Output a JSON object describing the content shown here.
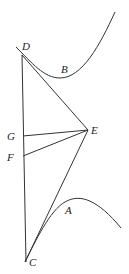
{
  "diagram": {
    "type": "geometric-construction",
    "stroke_color": "#333333",
    "label_color": "#222222",
    "points": {
      "D": {
        "label": "D",
        "x": 22,
        "y": 55
      },
      "B": {
        "label": "B",
        "x": 65,
        "y": 70
      },
      "E": {
        "label": "E",
        "x": 88,
        "y": 130
      },
      "G": {
        "label": "G",
        "x": 23,
        "y": 136
      },
      "F": {
        "label": "F",
        "x": 23,
        "y": 156
      },
      "A": {
        "label": "A",
        "x": 70,
        "y": 211
      },
      "C": {
        "label": "C",
        "x": 25,
        "y": 262
      }
    },
    "segments": [
      "DC",
      "DE",
      "GE",
      "FE",
      "CE"
    ],
    "curves": [
      {
        "name": "upper-curve",
        "through": "B",
        "tangent_at": "D"
      },
      {
        "name": "lower-curve",
        "through": "A",
        "tangent_at": "C"
      }
    ]
  }
}
